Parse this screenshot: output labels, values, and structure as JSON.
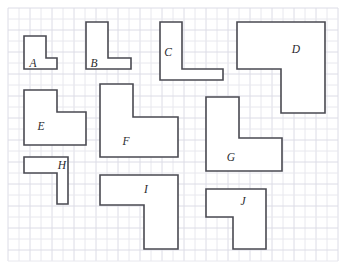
{
  "worksheet": {
    "title": "L-Shape Area Worksheet Grid",
    "width": 349,
    "height": 272,
    "background_color": "#ffffff"
  },
  "grid": {
    "origin_x": 8,
    "origin_y": 8,
    "cell_size": 11,
    "cols": 30,
    "rows": 23,
    "line_color": "#e8e8ee",
    "major_line_color": "#dcdce6",
    "major_every": 2,
    "visible": true
  },
  "style": {
    "shape_stroke_color": "#4a4a52",
    "shape_fill_color": "#ffffff",
    "shape_stroke_width": 1.6,
    "label_color": "#2a2a2e",
    "label_font_size": 11.5,
    "label_style": "italic"
  },
  "shapes": [
    {
      "label": "A",
      "name": "shape-a",
      "points": "24,36 46,36 46,58 57,58 57,69 24,69",
      "label_x": 33,
      "label_y": 64,
      "bbox": [
        24,
        36,
        57,
        69
      ]
    },
    {
      "label": "B",
      "name": "shape-b",
      "points": "86,22 108,22 108,58 131,58 131,69 86,69",
      "label_x": 94,
      "label_y": 64,
      "bbox": [
        86,
        22,
        131,
        69
      ]
    },
    {
      "label": "C",
      "name": "shape-c",
      "points": "160,22 182,22 182,69 223,69 223,80 160,80",
      "label_x": 168,
      "label_y": 53,
      "bbox": [
        160,
        22,
        223,
        80
      ]
    },
    {
      "label": "D",
      "name": "shape-d",
      "points": "237,22 325,22 325,113 281,113 281,69 237,69",
      "label_x": 296,
      "label_y": 50,
      "bbox": [
        237,
        22,
        325,
        113
      ]
    },
    {
      "label": "E",
      "name": "shape-e",
      "points": "24,90 57,90 57,112 86,112 86,145 24,145",
      "label_x": 41,
      "label_y": 127,
      "bbox": [
        24,
        90,
        86,
        145
      ]
    },
    {
      "label": "F",
      "name": "shape-f",
      "points": "100,84 133,84 133,117 178,117 178,157 100,157",
      "label_x": 126,
      "label_y": 142,
      "bbox": [
        100,
        84,
        178,
        157
      ]
    },
    {
      "label": "G",
      "name": "shape-g",
      "points": "206,97 239,97 239,138 282,138 282,171 206,171",
      "label_x": 231,
      "label_y": 158,
      "bbox": [
        206,
        97,
        282,
        171
      ]
    },
    {
      "label": "H",
      "name": "shape-h",
      "points": "24,157 68,157 68,204 57,204 57,173 24,173",
      "label_x": 62,
      "label_y": 166,
      "bbox": [
        24,
        157,
        68,
        204
      ]
    },
    {
      "label": "I",
      "name": "shape-i",
      "points": "100,175 178,175 178,249 144,249 144,205 100,205",
      "label_x": 146,
      "label_y": 190,
      "bbox": [
        100,
        175,
        178,
        249
      ]
    },
    {
      "label": "J",
      "name": "shape-j",
      "points": "206,189 266,189 266,249 233,249 233,217 206,217",
      "label_x": 243,
      "label_y": 202,
      "bbox": [
        206,
        189,
        266,
        249
      ]
    }
  ]
}
